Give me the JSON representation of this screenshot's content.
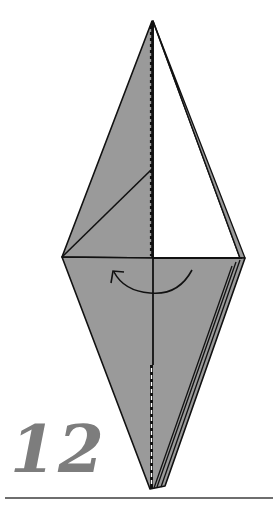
{
  "diagram": {
    "type": "origami-instruction-step",
    "step_number": "12",
    "colors": {
      "paper_colored": "#9a9a9a",
      "paper_white": "#ffffff",
      "line": "#111111",
      "step_number": "#7d7d7d",
      "rule": "#6e6e6e"
    },
    "symbols": [
      {
        "name": "valley-fold-line",
        "description": "dashed center line, upper and lower sections"
      },
      {
        "name": "turn-over-flap-arrow",
        "description": "curved arrow from right to left around center"
      }
    ]
  }
}
